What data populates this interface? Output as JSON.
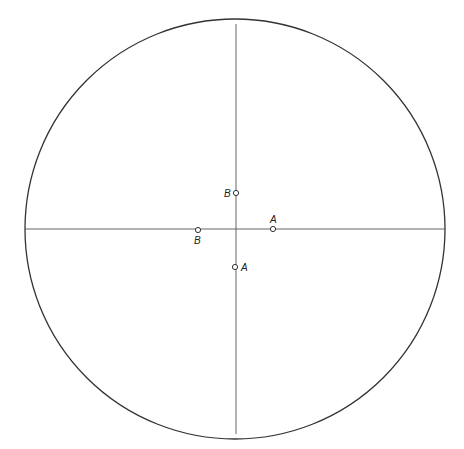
{
  "diagram": {
    "circle": {
      "cx": 235,
      "cy": 229,
      "r": 210
    },
    "crosshair": {
      "vertical_x": 235,
      "horizontal_y": 229
    },
    "points": [
      {
        "label": "B",
        "x": 235,
        "y": 192,
        "label_side": "left"
      },
      {
        "label": "A",
        "x": 272,
        "y": 229,
        "label_side": "above"
      },
      {
        "label": "B",
        "x": 198,
        "y": 229,
        "label_side": "below"
      },
      {
        "label": "A",
        "x": 235,
        "y": 267,
        "label_side": "right"
      }
    ],
    "colors": {
      "stroke": "#333333",
      "background": "#ffffff"
    }
  }
}
